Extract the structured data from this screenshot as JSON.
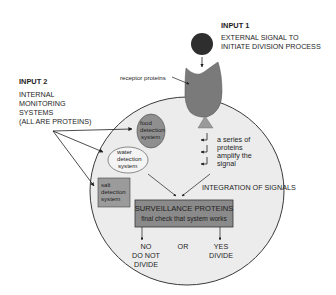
{
  "diagram": {
    "type": "cell-division-signaling",
    "colors": {
      "background": "#ffffff",
      "cell_fill": "#ececec",
      "cell_stroke": "#3a3a3a",
      "signal_molecule": "#2e2e2e",
      "receptor": "#7a7a7a",
      "receptor_base": "#9a9a9a",
      "food_system": "#8f8f8f",
      "water_system": "#f4f4f4",
      "salt_system": "#9b9b9b",
      "surveillance_box": "#8a8a8a",
      "arrow": "#1e1e1e",
      "text": "#1e1e1e"
    },
    "input1": {
      "heading": "INPUT 1",
      "lines": [
        "EXTERNAL SIGNAL TO",
        "INITIATE DIVISION PROCESS"
      ]
    },
    "input2": {
      "heading": "INPUT 2",
      "lines": [
        "INTERNAL",
        "MONITORING",
        "SYSTEMS",
        "(ALL ARE PROTEINS)"
      ]
    },
    "receptor_label": "receptor proteins",
    "cascade_label": [
      "a series of",
      "proteins",
      "amplify the",
      "signal"
    ],
    "food_system": [
      "food",
      "detection",
      "system"
    ],
    "water_system": [
      "water",
      "detection",
      "system"
    ],
    "salt_system": [
      "salt",
      "detection",
      "system"
    ],
    "integration_label": "INTEGRATION OF SIGNALS",
    "surveillance": {
      "title": "SURVEILLANCE PROTEINS",
      "subtitle": "final check that system works"
    },
    "outcomes": {
      "no": [
        "NO",
        "DO NOT",
        "DIVIDE"
      ],
      "or": "OR",
      "yes": [
        "YES",
        "DIVIDE"
      ]
    }
  }
}
